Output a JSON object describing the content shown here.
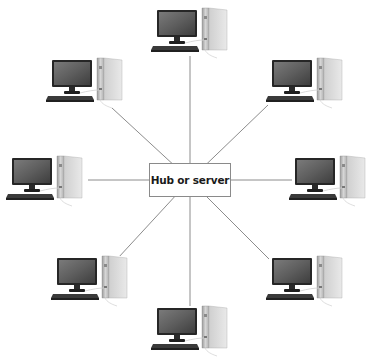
{
  "diagram": {
    "type": "star-topology",
    "hub": {
      "label": "Hub or server"
    },
    "nodes": [
      {
        "id": "top",
        "label": "",
        "icon": "desktop-computer-icon"
      },
      {
        "id": "top-right",
        "label": "",
        "icon": "desktop-computer-icon"
      },
      {
        "id": "right",
        "label": "",
        "icon": "desktop-computer-icon"
      },
      {
        "id": "bottom-right",
        "label": "",
        "icon": "desktop-computer-icon"
      },
      {
        "id": "bottom",
        "label": "",
        "icon": "desktop-computer-icon"
      },
      {
        "id": "bottom-left",
        "label": "",
        "icon": "desktop-computer-icon"
      },
      {
        "id": "left",
        "label": "",
        "icon": "desktop-computer-icon"
      },
      {
        "id": "top-left",
        "label": "",
        "icon": "desktop-computer-icon"
      }
    ],
    "edges": [
      {
        "from": "hub",
        "to": "top"
      },
      {
        "from": "hub",
        "to": "top-right"
      },
      {
        "from": "hub",
        "to": "right"
      },
      {
        "from": "hub",
        "to": "bottom-right"
      },
      {
        "from": "hub",
        "to": "bottom"
      },
      {
        "from": "hub",
        "to": "bottom-left"
      },
      {
        "from": "hub",
        "to": "left"
      },
      {
        "from": "hub",
        "to": "top-left"
      }
    ],
    "colors": {
      "line": "#8c8c8c",
      "monitor_bezel": "#2b2b2b",
      "screen": "#5a5a5a",
      "tower": "#c8c8c8",
      "keyboard": "#3a3a3a"
    }
  }
}
